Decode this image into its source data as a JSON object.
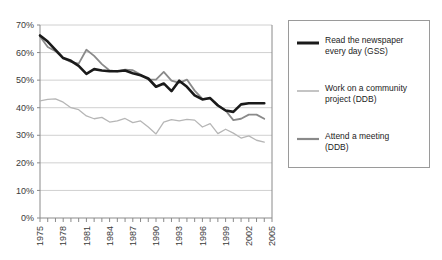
{
  "chart_data": {
    "type": "line",
    "title": "",
    "xlabel": "",
    "ylabel": "",
    "xlim": [
      1975,
      2005
    ],
    "ylim": [
      0,
      70
    ],
    "ytick_step": 10,
    "ytick_labels": [
      "0%",
      "10%",
      "20%",
      "30%",
      "40%",
      "50%",
      "60%",
      "70%"
    ],
    "ytick_values": [
      0,
      10,
      20,
      30,
      40,
      50,
      60,
      70
    ],
    "xtick_labels": [
      "1975",
      "1978",
      "1981",
      "1984",
      "1987",
      "1990",
      "1993",
      "1996",
      "1999",
      "2002",
      "2005"
    ],
    "xtick_values": [
      1975,
      1978,
      1981,
      1984,
      1987,
      1990,
      1993,
      1996,
      1999,
      2002,
      2005
    ],
    "x_minor_ticks_every": 1,
    "grid": "horizontal",
    "legend_position": "right",
    "x": [
      1975,
      1976,
      1977,
      1978,
      1979,
      1980,
      1981,
      1982,
      1983,
      1984,
      1985,
      1986,
      1987,
      1988,
      1989,
      1990,
      1991,
      1992,
      1993,
      1994,
      1995,
      1996,
      1997,
      1998,
      1999,
      2000,
      2001,
      2002,
      2003,
      2004
    ],
    "series": [
      {
        "name": "Read the newspaper every day (GSS)",
        "short_name": "newspaper-gss",
        "color": "#1a1a1a",
        "width": 2.6,
        "values": [
          66.2,
          64.0,
          61.0,
          58.0,
          57.0,
          55.2,
          52.3,
          54.0,
          53.5,
          53.2,
          53.2,
          53.5,
          52.5,
          51.8,
          50.6,
          47.6,
          48.8,
          46.0,
          49.8,
          47.6,
          44.5,
          43.0,
          43.5,
          40.8,
          39.0,
          38.5,
          41.2,
          41.6,
          41.6,
          41.6
        ]
      },
      {
        "name": "Work on a community project (DDB)",
        "short_name": "community-project-ddb",
        "color": "#b6b6b6",
        "width": 1.3,
        "values": [
          42.5,
          43.0,
          43.2,
          42.0,
          40.0,
          39.3,
          37.0,
          36.0,
          36.5,
          34.8,
          35.2,
          36.1,
          34.6,
          35.2,
          33.0,
          30.5,
          34.8,
          35.7,
          35.2,
          35.8,
          35.5,
          33.0,
          34.2,
          30.6,
          32.2,
          30.8,
          29.0,
          29.8,
          28.2,
          27.5
        ]
      },
      {
        "name": "Attend a meeting (DDB)",
        "short_name": "attend-meeting-ddb",
        "color": "#8a8a8a",
        "width": 1.8,
        "values": [
          65.8,
          62.0,
          60.5,
          58.0,
          56.6,
          56.0,
          61.0,
          58.8,
          55.8,
          53.5,
          53.2,
          53.8,
          53.6,
          52.0,
          50.2,
          50.2,
          53.0,
          49.8,
          49.0,
          50.2,
          46.2,
          43.2,
          43.4,
          41.0,
          39.0,
          35.5,
          36.0,
          37.5,
          37.5,
          36.0
        ]
      }
    ]
  },
  "legend": {
    "items": [
      {
        "label": "Read the newspaper\never y day (GSS)",
        "text": "Read the newspaper\nevery day (GSS)",
        "swatch_name": "legend-swatch-newspaper"
      },
      {
        "label": "Work on a community\nproject (DDB)",
        "text": "Work on a community\nproject (DDB)",
        "swatch_name": "legend-swatch-community"
      },
      {
        "label": "Attend a meeting\n(DDB)",
        "text": "Attend a meeting\n(DDB)",
        "swatch_name": "legend-swatch-meeting"
      }
    ]
  },
  "colors": {
    "axis": "#8a8a8a",
    "grid": "#d0d0d0",
    "text": "#3a3a3a",
    "background": "#ffffff"
  }
}
